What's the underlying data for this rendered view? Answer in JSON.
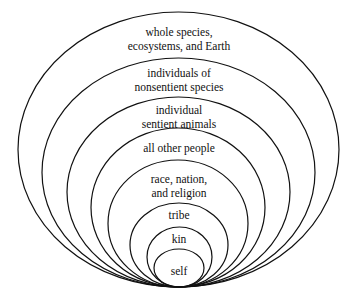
{
  "diagram": {
    "type": "nested-circles",
    "center_x": 179,
    "bottom_y": 287,
    "rings": [
      {
        "label_lines": [
          "whole species,",
          "ecosystems, and Earth"
        ],
        "top": 12,
        "left": 18,
        "right": 339,
        "label_y": 25
      },
      {
        "label_lines": [
          "individuals of",
          "nonsentient species"
        ],
        "top": 58,
        "left": 42,
        "right": 315,
        "label_y": 66
      },
      {
        "label_lines": [
          "individual",
          "sentient animals"
        ],
        "top": 97,
        "left": 67,
        "right": 290,
        "label_y": 103
      },
      {
        "label_lines": [
          "all other people"
        ],
        "top": 128,
        "left": 91,
        "right": 265,
        "label_y": 142
      },
      {
        "label_lines": [
          "race, nation,",
          "and religion"
        ],
        "top": 160,
        "left": 108,
        "right": 248,
        "label_y": 172
      },
      {
        "label_lines": [
          "tribe"
        ],
        "top": 203,
        "left": 130,
        "right": 228,
        "label_y": 208
      },
      {
        "label_lines": [
          "kin"
        ],
        "top": 227,
        "left": 147,
        "right": 212,
        "label_y": 232
      },
      {
        "label_lines": [
          "self"
        ],
        "top": 249,
        "left": 154,
        "right": 204,
        "label_y": 264
      }
    ]
  },
  "labels": {
    "r0a": "whole species,",
    "r0b": "ecosystems, and Earth",
    "r1a": "individuals of",
    "r1b": "nonsentient species",
    "r2a": "individual",
    "r2b": "sentient animals",
    "r3": "all other people",
    "r4a": "race, nation,",
    "r4b": "and religion",
    "r5": "tribe",
    "r6": "kin",
    "r7": "self"
  },
  "colors": {
    "stroke": "#111111",
    "background": "#ffffff"
  }
}
